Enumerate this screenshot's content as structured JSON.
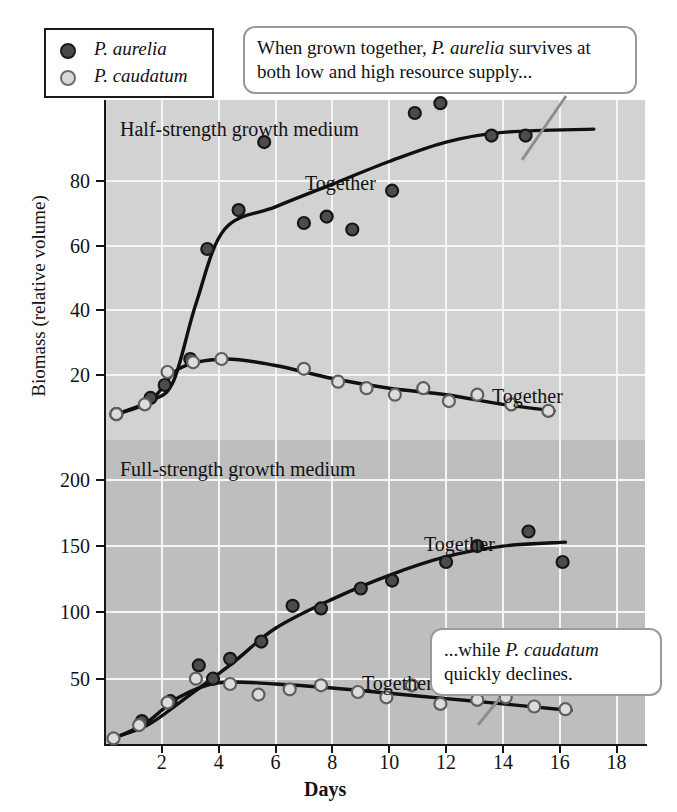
{
  "legend": {
    "items": [
      {
        "label": "P. aurelia",
        "marker": "filled-circle",
        "color": "#4a4a4a"
      },
      {
        "label": "P. caudatum",
        "marker": "open-circle",
        "color": "#d8d8d8"
      }
    ]
  },
  "callouts": [
    {
      "id": "callout-upper",
      "text": "When grown together, P. aurelia survives at both low and high resource supply...",
      "italic_part": "P. aurelia"
    },
    {
      "id": "callout-lower",
      "text": "...while P. caudatum quickly declines.",
      "italic_part": "P. caudatum"
    }
  ],
  "panel_labels": {
    "upper": "Half-strength growth medium",
    "lower": "Full-strength growth medium"
  },
  "curve_labels": {
    "upper_aurelia": "Together",
    "upper_caudatum": "Together",
    "lower_aurelia": "Together",
    "lower_caudatum": "Together"
  },
  "chart_data": {
    "type": "scatter",
    "title": "",
    "xlabel": "Days",
    "ylabel": "Biomass (relative volume)",
    "grid": true,
    "legend_position": "top-left",
    "xlim": [
      0,
      19
    ],
    "xticks": [
      2,
      4,
      6,
      8,
      10,
      12,
      14,
      16,
      18
    ],
    "panels": [
      {
        "name": "Half-strength growth medium",
        "band_color": "#d2d2d2",
        "ylim": [
          0,
          105
        ],
        "yticks": [
          20,
          40,
          60,
          80
        ],
        "series": [
          {
            "name": "P. aurelia",
            "marker": "filled-circle",
            "label": "Together",
            "points": [
              {
                "x": 0.4,
                "y": 8
              },
              {
                "x": 1.6,
                "y": 13
              },
              {
                "x": 2.1,
                "y": 17
              },
              {
                "x": 3.0,
                "y": 25
              },
              {
                "x": 3.6,
                "y": 59
              },
              {
                "x": 4.7,
                "y": 71
              },
              {
                "x": 5.6,
                "y": 92
              },
              {
                "x": 7.0,
                "y": 67
              },
              {
                "x": 7.8,
                "y": 69
              },
              {
                "x": 8.7,
                "y": 65
              },
              {
                "x": 10.1,
                "y": 77
              },
              {
                "x": 10.9,
                "y": 101
              },
              {
                "x": 11.8,
                "y": 104
              },
              {
                "x": 13.6,
                "y": 94
              },
              {
                "x": 14.8,
                "y": 94
              }
            ],
            "fit_curve": [
              {
                "x": 0.4,
                "y": 8
              },
              {
                "x": 1.6,
                "y": 12
              },
              {
                "x": 2.4,
                "y": 18
              },
              {
                "x": 3.2,
                "y": 42
              },
              {
                "x": 4.2,
                "y": 65
              },
              {
                "x": 6.0,
                "y": 72
              },
              {
                "x": 8.0,
                "y": 79
              },
              {
                "x": 10.0,
                "y": 86
              },
              {
                "x": 12.0,
                "y": 92
              },
              {
                "x": 14.0,
                "y": 95
              },
              {
                "x": 17.2,
                "y": 96
              }
            ]
          },
          {
            "name": "P. caudatum",
            "marker": "open-circle",
            "label": "Together",
            "points": [
              {
                "x": 0.4,
                "y": 8
              },
              {
                "x": 1.4,
                "y": 11
              },
              {
                "x": 2.2,
                "y": 21
              },
              {
                "x": 3.1,
                "y": 24
              },
              {
                "x": 4.1,
                "y": 25
              },
              {
                "x": 7.0,
                "y": 22
              },
              {
                "x": 8.2,
                "y": 18
              },
              {
                "x": 9.2,
                "y": 16
              },
              {
                "x": 10.2,
                "y": 14
              },
              {
                "x": 11.2,
                "y": 16
              },
              {
                "x": 12.1,
                "y": 12
              },
              {
                "x": 13.1,
                "y": 14
              },
              {
                "x": 14.3,
                "y": 11
              },
              {
                "x": 15.6,
                "y": 9
              }
            ],
            "fit_curve": [
              {
                "x": 0.4,
                "y": 8
              },
              {
                "x": 1.6,
                "y": 12
              },
              {
                "x": 2.6,
                "y": 22
              },
              {
                "x": 4.2,
                "y": 25
              },
              {
                "x": 6.0,
                "y": 23
              },
              {
                "x": 8.0,
                "y": 19
              },
              {
                "x": 10.0,
                "y": 16
              },
              {
                "x": 12.0,
                "y": 14
              },
              {
                "x": 14.0,
                "y": 11
              },
              {
                "x": 15.8,
                "y": 9
              }
            ]
          }
        ]
      },
      {
        "name": "Full-strength growth medium",
        "band_color": "#bebebe",
        "ylim": [
          0,
          230
        ],
        "yticks": [
          50,
          100,
          150,
          200
        ],
        "series": [
          {
            "name": "P. aurelia",
            "marker": "filled-circle",
            "label": "Together",
            "points": [
              {
                "x": 1.3,
                "y": 18
              },
              {
                "x": 2.3,
                "y": 33
              },
              {
                "x": 3.3,
                "y": 60
              },
              {
                "x": 3.8,
                "y": 50
              },
              {
                "x": 4.4,
                "y": 65
              },
              {
                "x": 5.5,
                "y": 78
              },
              {
                "x": 6.6,
                "y": 105
              },
              {
                "x": 7.6,
                "y": 103
              },
              {
                "x": 9.0,
                "y": 118
              },
              {
                "x": 10.1,
                "y": 124
              },
              {
                "x": 12.0,
                "y": 138
              },
              {
                "x": 13.1,
                "y": 150
              },
              {
                "x": 14.9,
                "y": 161
              },
              {
                "x": 16.1,
                "y": 138
              }
            ],
            "fit_curve": [
              {
                "x": 0.2,
                "y": 5
              },
              {
                "x": 1.5,
                "y": 15
              },
              {
                "x": 3.0,
                "y": 38
              },
              {
                "x": 4.5,
                "y": 62
              },
              {
                "x": 6.0,
                "y": 88
              },
              {
                "x": 8.0,
                "y": 110
              },
              {
                "x": 10.0,
                "y": 128
              },
              {
                "x": 12.0,
                "y": 142
              },
              {
                "x": 14.0,
                "y": 150
              },
              {
                "x": 16.2,
                "y": 153
              }
            ]
          },
          {
            "name": "P. caudatum",
            "marker": "open-circle",
            "label": "Together",
            "points": [
              {
                "x": 0.3,
                "y": 5
              },
              {
                "x": 1.2,
                "y": 15
              },
              {
                "x": 2.2,
                "y": 32
              },
              {
                "x": 3.2,
                "y": 50
              },
              {
                "x": 4.4,
                "y": 46
              },
              {
                "x": 5.4,
                "y": 38
              },
              {
                "x": 6.5,
                "y": 42
              },
              {
                "x": 7.6,
                "y": 45
              },
              {
                "x": 8.9,
                "y": 40
              },
              {
                "x": 9.9,
                "y": 36
              },
              {
                "x": 10.8,
                "y": 45
              },
              {
                "x": 11.8,
                "y": 31
              },
              {
                "x": 13.1,
                "y": 34
              },
              {
                "x": 14.1,
                "y": 36
              },
              {
                "x": 15.1,
                "y": 29
              },
              {
                "x": 16.2,
                "y": 27
              }
            ],
            "fit_curve": [
              {
                "x": 0.2,
                "y": 4
              },
              {
                "x": 1.4,
                "y": 16
              },
              {
                "x": 2.6,
                "y": 36
              },
              {
                "x": 4.0,
                "y": 47
              },
              {
                "x": 6.0,
                "y": 46
              },
              {
                "x": 8.0,
                "y": 43
              },
              {
                "x": 10.0,
                "y": 39
              },
              {
                "x": 12.0,
                "y": 35
              },
              {
                "x": 14.0,
                "y": 31
              },
              {
                "x": 16.4,
                "y": 26
              }
            ]
          }
        ]
      }
    ]
  }
}
